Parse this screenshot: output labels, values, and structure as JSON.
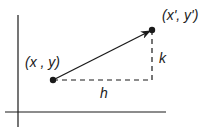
{
  "diagram": {
    "type": "vector-translation",
    "colors": {
      "stroke": "#1a1a1a",
      "background": "#ffffff"
    },
    "points": {
      "start": {
        "label": "(x , y)"
      },
      "end": {
        "label": "(x', y')"
      }
    },
    "components": {
      "horizontal": {
        "label": "h"
      },
      "vertical": {
        "label": "k"
      }
    }
  }
}
